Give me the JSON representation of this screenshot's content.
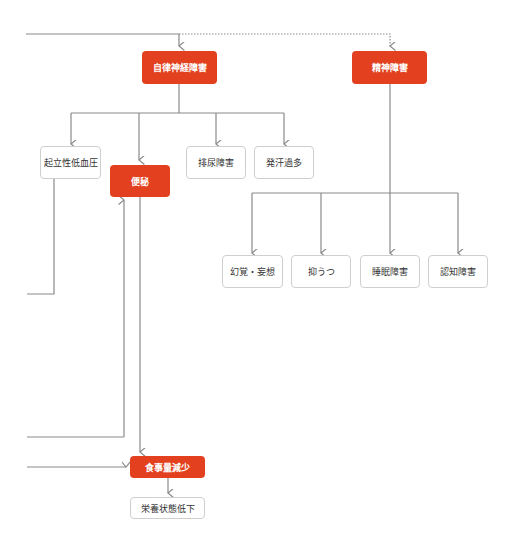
{
  "colors": {
    "accent": "#e2401f",
    "line": "#8a8a8a",
    "box_border": "#cfcfcf",
    "text": "#333333"
  },
  "nodes": {
    "autonomic": "自律神経障害",
    "psychiatric": "精神障害",
    "orthostatic": "起立性低血圧",
    "constipation": "便秘",
    "urinary": "排尿障害",
    "sweating": "発汗過多",
    "hallucination": "幻覚・妄想",
    "depression": "抑うつ",
    "sleep": "睡眠障害",
    "cognitive": "認知障害",
    "food_intake": "食事量減少",
    "nutrition": "栄養状態低下"
  }
}
